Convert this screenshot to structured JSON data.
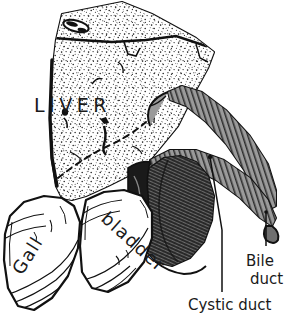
{
  "figure": {
    "style": "pen-and-ink stipple engraving",
    "background_color": "#ffffff",
    "ink_color": "#111111"
  },
  "labels": {
    "liver": "LIVER",
    "gall": "Gall",
    "bladder": "bladder",
    "bile_duct_line1": "Bile",
    "bile_duct_line2": "duct",
    "cystic_duct": "Cystic duct"
  },
  "structures": [
    {
      "name": "liver",
      "label": "LIVER",
      "shading": "stipple",
      "tone": "#ffffff"
    },
    {
      "name": "gallbladder",
      "label": "Gall bladder",
      "shading": "dense-hatch",
      "tone": "#4a4a4a"
    },
    {
      "name": "bile-duct",
      "label": "Bile duct",
      "shading": "cross-hatch",
      "tone": "#8a8a8a"
    },
    {
      "name": "cystic-duct",
      "label": "Cystic duct",
      "shading": "cross-hatch",
      "tone": "#8a8a8a"
    },
    {
      "name": "left-lobe",
      "label": "",
      "shading": "contour-hatch",
      "tone": "#ffffff"
    },
    {
      "name": "right-lobe",
      "label": "",
      "shading": "contour-hatch",
      "tone": "#ffffff"
    }
  ],
  "leaders": [
    {
      "name": "bile-duct-leader",
      "from": "bile duct tip",
      "to": "Bile duct"
    },
    {
      "name": "cystic-duct-leader",
      "from": "cystic duct junction",
      "to": "Cystic duct"
    }
  ]
}
